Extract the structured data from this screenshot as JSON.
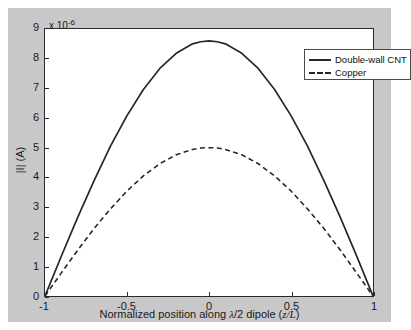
{
  "chart_data": {
    "type": "line",
    "title": "",
    "xlabel": "Normalized position along λ/2 dipole (z/L)",
    "ylabel": "|I| (A)",
    "y_multiplier": "x 10",
    "y_multiplier_exp": "-6",
    "xlim": [
      -1,
      1
    ],
    "ylim": [
      0,
      9
    ],
    "xticks": [
      -1,
      -0.5,
      0,
      0.5,
      1
    ],
    "xticklabels": [
      "-1",
      "-0.5",
      "0",
      "0.5",
      "1"
    ],
    "yticks": [
      0,
      1,
      2,
      3,
      4,
      5,
      6,
      7,
      8,
      9
    ],
    "yticklabels": [
      "0",
      "1",
      "2",
      "3",
      "4",
      "5",
      "6",
      "7",
      "8",
      "9"
    ],
    "grid": false,
    "legend_position": "top-right",
    "series": [
      {
        "name": "Double-wall CNT",
        "style": "solid",
        "color": "#262626",
        "peak": 8.6,
        "x": [
          -1,
          -0.9,
          -0.8,
          -0.7,
          -0.6,
          -0.5,
          -0.4,
          -0.3,
          -0.2,
          -0.1,
          -0.05,
          0,
          0.05,
          0.1,
          0.2,
          0.3,
          0.4,
          0.5,
          0.6,
          0.7,
          0.8,
          0.9,
          1
        ],
        "values": [
          0,
          1.35,
          2.66,
          3.9,
          5.06,
          6.08,
          6.96,
          7.67,
          8.18,
          8.5,
          8.57,
          8.6,
          8.57,
          8.5,
          8.18,
          7.67,
          6.96,
          6.08,
          5.06,
          3.9,
          2.66,
          1.35,
          0
        ]
      },
      {
        "name": "Copper",
        "style": "dashed",
        "color": "#262626",
        "peak": 5.0,
        "x": [
          -1,
          -0.9,
          -0.8,
          -0.7,
          -0.6,
          -0.5,
          -0.4,
          -0.3,
          -0.2,
          -0.1,
          -0.05,
          0,
          0.05,
          0.1,
          0.2,
          0.3,
          0.4,
          0.5,
          0.6,
          0.7,
          0.8,
          0.9,
          1
        ],
        "values": [
          0,
          0.78,
          1.55,
          2.28,
          2.94,
          3.54,
          4.05,
          4.46,
          4.76,
          4.94,
          4.99,
          5.0,
          4.99,
          4.94,
          4.76,
          4.46,
          4.05,
          3.54,
          2.94,
          2.28,
          1.55,
          0.78,
          0
        ]
      }
    ]
  },
  "legend": {
    "items": [
      {
        "label": "Double-wall CNT",
        "style": "solid"
      },
      {
        "label": "Copper",
        "style": "dashed"
      }
    ]
  }
}
